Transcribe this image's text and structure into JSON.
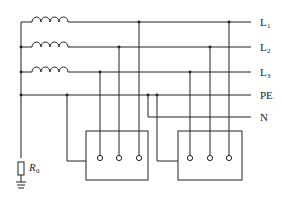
{
  "diagram": {
    "type": "TN-C-S / TN-S power distribution schematic",
    "lines": [
      {
        "id": "L1",
        "label": "L",
        "subscript": "1"
      },
      {
        "id": "L2",
        "label": "L",
        "subscript": "2"
      },
      {
        "id": "L3",
        "label": "L",
        "subscript": "3"
      },
      {
        "id": "PE",
        "label": "PE",
        "subscript": ""
      },
      {
        "id": "N",
        "label": "N",
        "subscript": ""
      }
    ],
    "ground_resistor": {
      "label": "R",
      "subscript": "0"
    },
    "loads": [
      {
        "id": "load-1",
        "terminals": 3,
        "connections": [
          "L3",
          "L2",
          "L1"
        ],
        "pe_connected": true
      },
      {
        "id": "load-2",
        "terminals": 3,
        "connections": [
          "L3",
          "L2",
          "L1"
        ],
        "pe_connected": true
      }
    ],
    "caption": ""
  }
}
